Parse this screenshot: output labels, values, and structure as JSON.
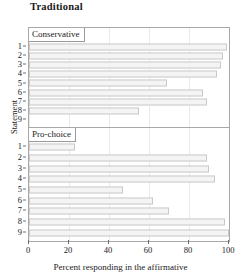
{
  "chart_data": {
    "type": "bar",
    "title": "Traditional",
    "xlabel": "Percent responding in the affirmative",
    "ylabel": "Statement",
    "orientation": "horizontal",
    "xlim": [
      0,
      100
    ],
    "xticks": [
      0,
      20,
      40,
      60,
      80,
      100
    ],
    "xtick_labels": [
      "0",
      "20",
      "40",
      "60",
      "80",
      "100"
    ],
    "categories": [
      "1",
      "2",
      "3",
      "4",
      "5",
      "6",
      "7",
      "8",
      "9"
    ],
    "grid": "vertical",
    "legend": "none",
    "panel_layout": "stacked rows, shared x-axis",
    "panels": [
      {
        "name": "Conservative",
        "strip_label": "Conservative",
        "categories": [
          "1",
          "2",
          "3",
          "4",
          "5",
          "6",
          "7",
          "8",
          "9"
        ],
        "values": [
          99,
          97,
          96,
          94,
          69,
          87,
          89,
          55,
          0
        ]
      },
      {
        "name": "Pro-choice",
        "strip_label": "Pro-choice",
        "categories": [
          "1",
          "2",
          "3",
          "4",
          "5",
          "6",
          "7",
          "8",
          "9"
        ],
        "values": [
          23,
          89,
          90,
          93,
          47,
          62,
          70,
          98,
          100
        ]
      }
    ],
    "colors": {
      "bar_fill": "#f4f4f4",
      "bar_border": "#c9c9c9",
      "panel_border": "#a8a8a8",
      "gridline": "#e9e9e9",
      "text": "#1a1a1a"
    }
  }
}
